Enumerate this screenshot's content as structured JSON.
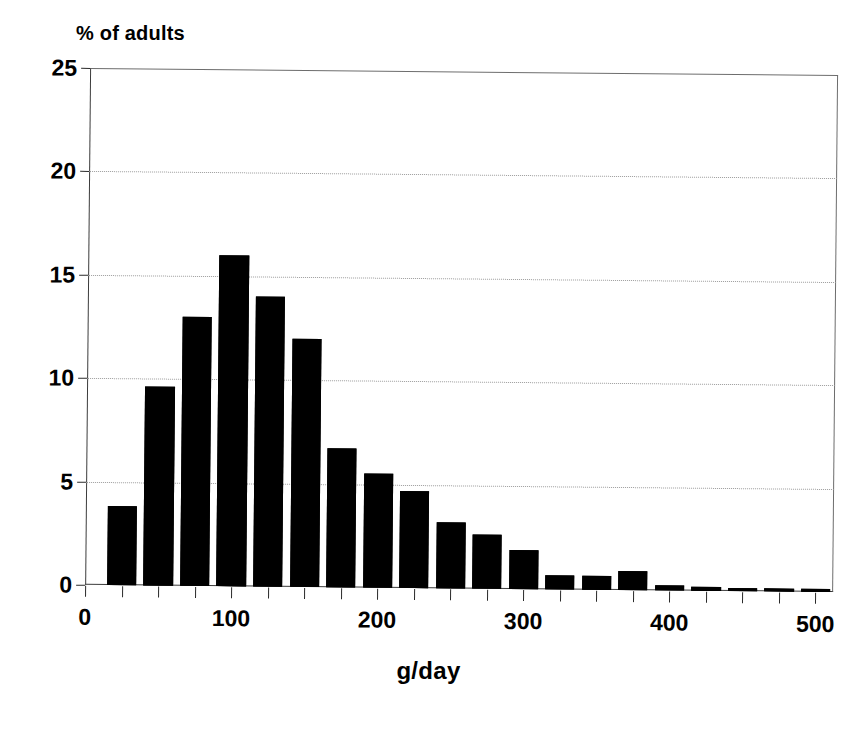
{
  "chart_data": {
    "type": "bar",
    "title": "",
    "ylabel": "% of adults",
    "xlabel": "g/day",
    "ylim": [
      0,
      25
    ],
    "xlim": [
      0,
      512
    ],
    "y_ticks": [
      0,
      5,
      10,
      15,
      20,
      25
    ],
    "y_tick_labels": [
      "0",
      "5",
      "10",
      "15",
      "20",
      "25"
    ],
    "x_ticks": [
      0,
      25,
      50,
      75,
      100,
      125,
      150,
      175,
      200,
      225,
      250,
      275,
      300,
      325,
      350,
      375,
      400,
      425,
      450,
      475,
      500
    ],
    "x_tick_labels": [
      {
        "value": 0,
        "label": "0"
      },
      {
        "value": 100,
        "label": "100"
      },
      {
        "value": 200,
        "label": "200"
      },
      {
        "value": 300,
        "label": "300"
      },
      {
        "value": 400,
        "label": "400"
      },
      {
        "value": 500,
        "label": "500"
      }
    ],
    "grid": "horizontal-dotted",
    "legend": null,
    "bar_color": "#000000",
    "bin_width": 25,
    "bar_draw_width": 20,
    "categories": [
      "12.5-37.5",
      "37.5-62.5",
      "62.5-87.5",
      "87.5-112.5",
      "112.5-137.5",
      "137.5-162.5",
      "162.5-187.5",
      "187.5-212.5",
      "212.5-237.5",
      "237.5-262.5",
      "262.5-287.5",
      "287.5-312.5",
      "312.5-337.5",
      "337.5-362.5",
      "362.5-387.5",
      "387.5-412.5",
      "412.5-437.5",
      "437.5-462.5",
      "462.5-487.5",
      "487.5-512.5"
    ],
    "bin_centers": [
      25,
      50,
      75,
      100,
      125,
      150,
      175,
      200,
      225,
      250,
      275,
      300,
      325,
      350,
      375,
      400,
      425,
      450,
      475,
      500
    ],
    "values": [
      3.8,
      9.6,
      13.0,
      16.0,
      14.0,
      12.0,
      6.7,
      5.5,
      4.7,
      3.2,
      2.6,
      1.9,
      0.7,
      0.7,
      0.9,
      0.25,
      0.2,
      0.15,
      0.15,
      0.15
    ]
  },
  "axes": {
    "y_title": "% of adults",
    "x_title": "g/day"
  }
}
